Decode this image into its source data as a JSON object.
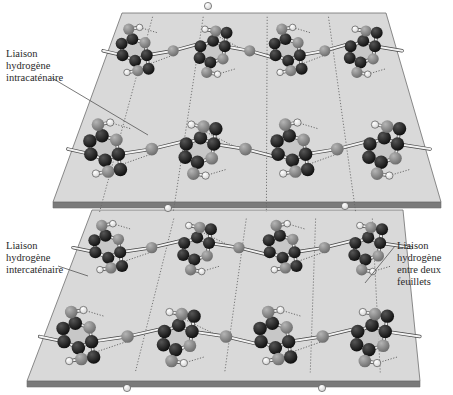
{
  "figure": {
    "colors": {
      "background": "#ffffff",
      "sheet_face": "#d9d9d9",
      "sheet_edge": "#7a7a7a",
      "sheet_outline": "#6e6e6e",
      "ring_fill": "#c4c4c4",
      "carbon": "#111111",
      "oxygen": "#8a8a8a",
      "hydrogen": "#ffffff",
      "bond": "#f2f2f2",
      "hbond": "#6a6a6a",
      "leader": "#555555"
    }
  },
  "labels": [
    {
      "id": "intra",
      "lines": [
        "Liaison",
        "hydrogène",
        "intracaténaire"
      ],
      "x": 6,
      "y": 36
    },
    {
      "id": "inter",
      "lines": [
        "Liaison",
        "hydrogène",
        "intercaténaire"
      ],
      "x": 6,
      "y": 228
    },
    {
      "id": "between",
      "lines": [
        "Liaison",
        "hydrogène",
        "entre deux",
        "feuillets"
      ],
      "x": 397,
      "y": 228
    }
  ],
  "leaders": [
    {
      "id": "intra",
      "x1": 52,
      "y1": 78,
      "x2": 148,
      "y2": 135
    },
    {
      "id": "inter",
      "x1": 58,
      "y1": 266,
      "x2": 88,
      "y2": 276
    },
    {
      "id": "between",
      "x1": 395,
      "y1": 246,
      "x2": 365,
      "y2": 283
    }
  ],
  "sheets": [
    {
      "id": "top",
      "tl": [
        122,
        13
      ],
      "tr": [
        386,
        13
      ],
      "br": [
        441,
        202
      ],
      "bl": [
        53,
        202
      ],
      "thickness": 6
    },
    {
      "id": "bottom",
      "tl": [
        92,
        210
      ],
      "tr": [
        403,
        210
      ],
      "br": [
        420,
        381
      ],
      "bl": [
        27,
        381
      ],
      "thickness": 6
    }
  ]
}
